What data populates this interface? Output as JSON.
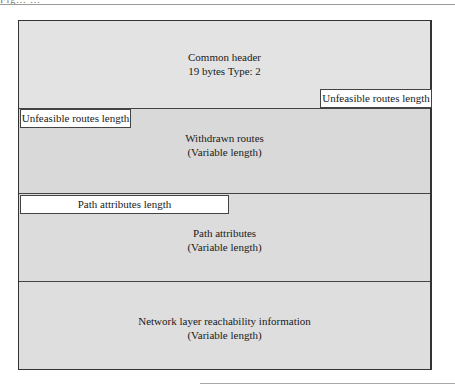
{
  "page": {
    "top_fragment": "Fig...  ...",
    "sections": {
      "header": {
        "line1": "Common header",
        "line2": "19 bytes   Type: 2"
      },
      "withdrawn": {
        "line1": "Withdrawn routes",
        "line2": "(Variable length)"
      },
      "path_attributes": {
        "line1": "Path attributes",
        "line2": "(Variable length)"
      },
      "nlri": {
        "line1": "Network layer reachability information",
        "line2": "(Variable length)"
      }
    },
    "fields": {
      "unfeasible_right": "Unfeasible routes length",
      "unfeasible_left": "Unfeasible routes length",
      "path_attributes_length": "Path attributes length"
    }
  }
}
